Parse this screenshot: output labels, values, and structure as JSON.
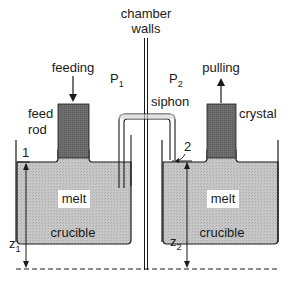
{
  "diagram": {
    "labels": {
      "chamber_line1": "chamber",
      "chamber_line2": "walls",
      "feeding": "feeding",
      "pulling": "pulling",
      "feed_rod_line1": "feed",
      "feed_rod_line2": "rod",
      "crystal": "crystal",
      "siphon": "siphon",
      "p1_main": "P",
      "p1_sub": "1",
      "p2_main": "P",
      "p2_sub": "2",
      "marker_1": "1",
      "marker_2": "2",
      "melt_left": "melt",
      "melt_right": "melt",
      "crucible_left": "crucible",
      "crucible_right": "crucible",
      "z1_main": "z",
      "z1_sub": "1",
      "z2_main": "z",
      "z2_sub": "2"
    },
    "colors": {
      "melt_fill": "#c4c4c4",
      "rod_fill": "#6a6a6a",
      "line": "#1a1a1a",
      "label_bg": "#ffffff"
    }
  }
}
